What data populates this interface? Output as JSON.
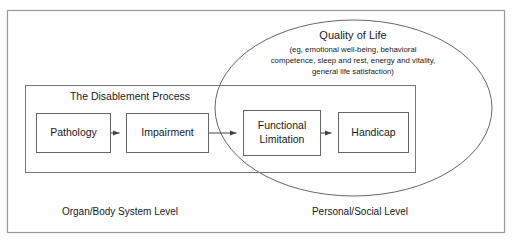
{
  "figure": {
    "frame": {
      "name": "outer-frame"
    },
    "quality_of_life": {
      "title": "Quality of Life",
      "subtitle_lines": [
        "(eg, emotional well-being, behavioral",
        "competence, sleep and rest, energy and vitality,",
        "general life satisfaction)"
      ]
    },
    "disablement_process": {
      "title": "The Disablement Process",
      "stages": [
        {
          "id": "pathology",
          "label": "Pathology",
          "lines": [
            "Pathology"
          ]
        },
        {
          "id": "impairment",
          "label": "Impairment",
          "lines": [
            "Impairment"
          ]
        },
        {
          "id": "functional-limitation",
          "label": "Functional Limitation",
          "lines": [
            "Functional",
            "Limitation"
          ]
        },
        {
          "id": "handicap",
          "label": "Handicap",
          "lines": [
            "Handicap"
          ]
        }
      ],
      "arrows": [
        {
          "from": "pathology",
          "to": "impairment"
        },
        {
          "from": "impairment",
          "to": "functional-limitation"
        },
        {
          "from": "functional-limitation",
          "to": "handicap"
        }
      ]
    },
    "levels": {
      "left": "Organ/Body System Level",
      "right": "Personal/Social Level"
    },
    "colors": {
      "stroke": "#555555",
      "frame_stroke": "#888888",
      "text": "#1a1a1a",
      "background": "#ffffff"
    }
  }
}
